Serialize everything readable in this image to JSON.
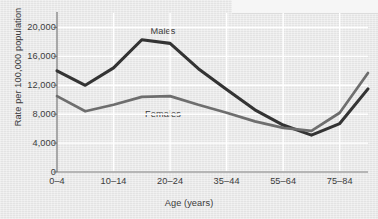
{
  "chart_data": {
    "type": "line",
    "title": "",
    "xlabel": "Age (years)",
    "ylabel": "Rate per 100,000 population",
    "x_tick_labels": [
      "0–4",
      "10–14",
      "20–24",
      "35–44",
      "55–64",
      "75–84"
    ],
    "y_tick_labels": [
      "0",
      "4,000",
      "8,000",
      "12,000",
      "16,000",
      "20,000"
    ],
    "y_tick_values": [
      0,
      4000,
      8000,
      12000,
      16000,
      20000
    ],
    "ylim": [
      0,
      22000
    ],
    "grid": true,
    "legend_position": "inline-annotation",
    "categories": [
      "0–4",
      "5–9",
      "10–14",
      "15–19",
      "20–24",
      "25–34",
      "35–44",
      "45–54",
      "55–64",
      "65–74",
      "75–84",
      "85+"
    ],
    "series": [
      {
        "name": "Males",
        "color": "#333333",
        "values": [
          14000,
          12000,
          14400,
          18300,
          17800,
          14300,
          11400,
          8600,
          6500,
          5100,
          6700,
          11500
        ]
      },
      {
        "name": "Females",
        "color": "#6e6e6e",
        "values": [
          10500,
          8400,
          9300,
          10400,
          10500,
          9300,
          8200,
          7000,
          6100,
          5700,
          8200,
          13700
        ]
      }
    ],
    "annotations": [
      {
        "text": "Males",
        "x_px": 163,
        "y_px": 31
      },
      {
        "text": "Females",
        "x_px": 163,
        "y_px": 114
      }
    ]
  },
  "axis": {
    "y_title": "Rate per 100,000 population",
    "x_title": "Age (years)"
  },
  "colors": {
    "background": "#e9e9e9",
    "gridline": "#ffffff",
    "axis": "#707070",
    "males": "#333333",
    "females": "#6e6e6e",
    "text": "#3b3b3b"
  }
}
